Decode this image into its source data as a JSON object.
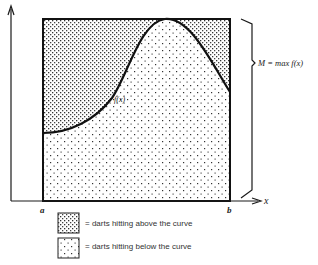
{
  "figure": {
    "curve_label": "f(x)",
    "brace_label": "M = max f(x)",
    "x_axis_label": "x",
    "tick_a": "a",
    "tick_b": "b"
  },
  "legend": {
    "items": [
      {
        "pattern": "dense-dots",
        "label": "= darts hitting above the curve"
      },
      {
        "pattern": "sparse-dots",
        "label": "= darts hitting below the curve"
      }
    ]
  },
  "colors": {
    "ink": "#1a1a1a",
    "background": "#ffffff"
  }
}
